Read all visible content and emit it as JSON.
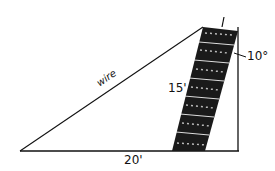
{
  "diagram": {
    "labels": {
      "wire": "wire",
      "tower_height": "15'",
      "angle": "10°",
      "base": "20'"
    },
    "colors": {
      "stroke": "#111111",
      "background": "#ffffff"
    }
  }
}
